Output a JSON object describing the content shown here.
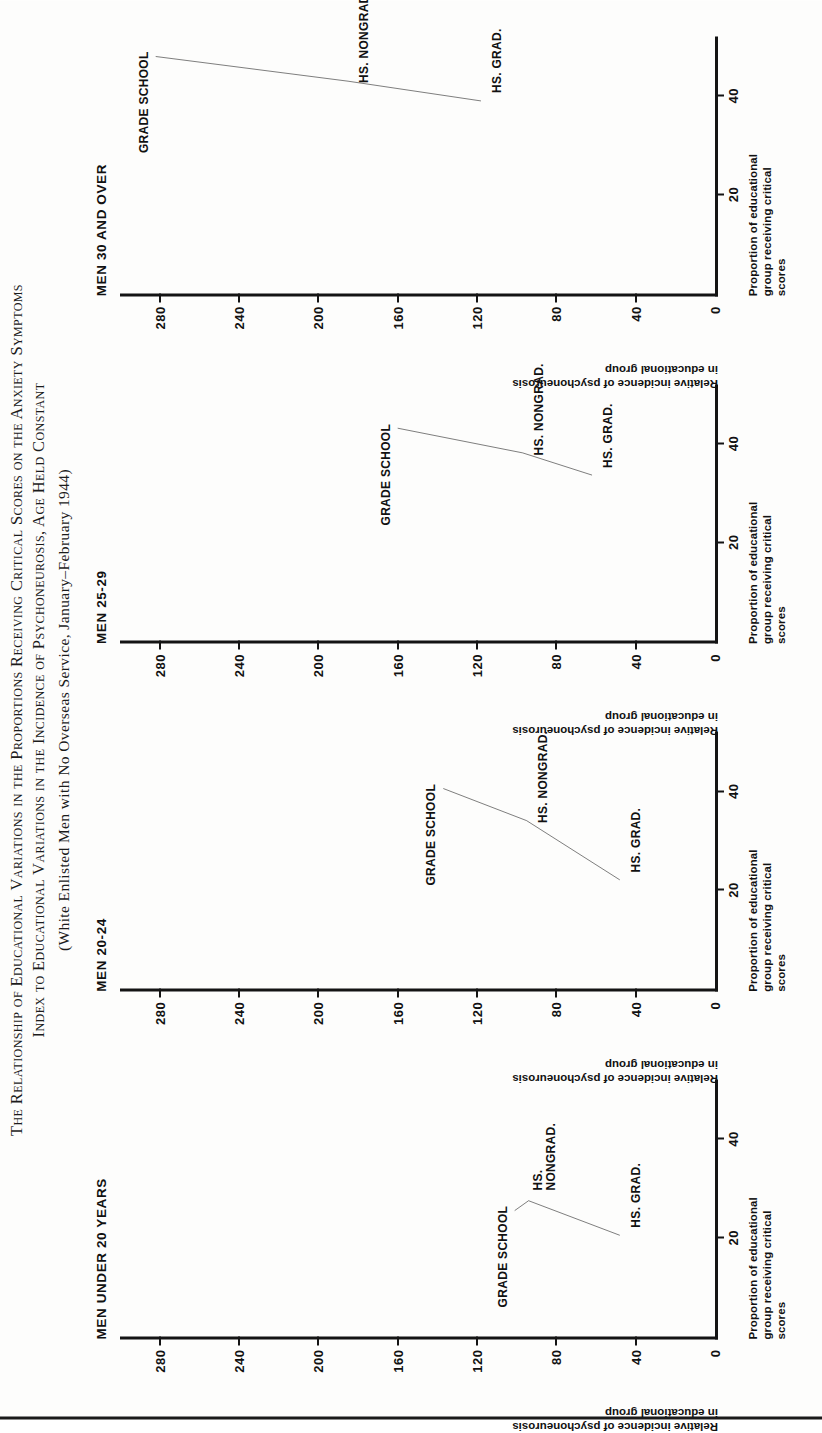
{
  "title": {
    "line1": "The Relationship of Educational Variations in the Proportions Receiving Critical Scores on the Anxiety Symptoms",
    "line2": "Index to Educational Variations in the Incidence of Psychoneurosis, Age Held Constant",
    "line3": "(White Enlisted Men with No Overseas Service, January–February 1944)"
  },
  "axis": {
    "y_caption_line1": "Relative incidence of psychoneurosis",
    "y_caption_line2": "in educational group",
    "x_caption_line1": "Proportion of educational",
    "x_caption_line2": "group receiving critical",
    "x_caption_line3": "scores",
    "y_ticks": [
      "280",
      "240",
      "200",
      "160",
      "120",
      "80",
      "40",
      "0"
    ],
    "y_values": [
      280,
      240,
      200,
      160,
      120,
      80,
      40,
      0
    ],
    "x_ticks": [
      "20",
      "40"
    ],
    "x_values": [
      20,
      40
    ],
    "ylim": [
      0,
      300
    ],
    "xlim": [
      0,
      52
    ]
  },
  "chart_data": {
    "type": "line",
    "subtitle": "(White Enlisted Men with No Overseas Service, January–February 1944)",
    "xlabel": "Proportion of educational group receiving critical scores",
    "ylabel": "Relative incidence of psychoneurosis in educational group",
    "xlim": [
      0,
      52
    ],
    "ylim": [
      0,
      300
    ],
    "grid": false,
    "legend": "none",
    "panels": [
      {
        "name": "MEN UNDER 20 YEARS",
        "points": [
          {
            "label": "GRADE SCHOOL",
            "x": 25.5,
            "y": 101
          },
          {
            "label": "HS.\nNONGRAD.",
            "x": 27.5,
            "y": 94
          },
          {
            "label": "HS. GRAD.",
            "x": 20.5,
            "y": 48
          }
        ]
      },
      {
        "name": "MEN 20-24",
        "points": [
          {
            "label": "GRADE SCHOOL",
            "x": 40.5,
            "y": 137
          },
          {
            "label": "HS. NONGRAD.",
            "x": 34.0,
            "y": 95
          },
          {
            "label": "HS. GRAD.",
            "x": 22.0,
            "y": 48
          }
        ]
      },
      {
        "name": "MEN 25-29",
        "points": [
          {
            "label": "GRADE SCHOOL",
            "x": 43.0,
            "y": 160
          },
          {
            "label": "HS. NONGRAD.",
            "x": 38.0,
            "y": 97
          },
          {
            "label": "HS. GRAD.",
            "x": 33.5,
            "y": 62
          }
        ]
      },
      {
        "name": "MEN 30 AND OVER",
        "points": [
          {
            "label": "GRADE SCHOOL",
            "x": 48.0,
            "y": 282
          },
          {
            "label": "HS. NONGRAD.",
            "x": 43.0,
            "y": 185
          },
          {
            "label": "HS. GRAD.",
            "x": 39.0,
            "y": 118
          }
        ]
      }
    ]
  }
}
